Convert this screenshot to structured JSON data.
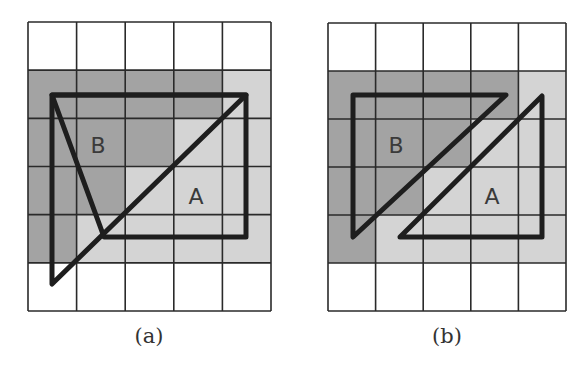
{
  "figure": {
    "colors": {
      "background": "#ffffff",
      "dark_cell": "#a3a3a3",
      "light_cell": "#d4d4d4",
      "grid_line": "#2a2a2a",
      "outline": "#1e1e1e",
      "text": "#3a3a3a"
    },
    "grid": {
      "cols": 5,
      "rows": 6
    },
    "cell_shading": [
      [
        "white",
        "white",
        "white",
        "white",
        "white"
      ],
      [
        "dark",
        "dark",
        "dark",
        "dark",
        "light"
      ],
      [
        "dark",
        "dark",
        "dark",
        "light",
        "light"
      ],
      [
        "dark",
        "dark",
        "light",
        "light",
        "light"
      ],
      [
        "dark",
        "light",
        "light",
        "light",
        "light"
      ],
      [
        "white",
        "white",
        "white",
        "white",
        "white"
      ]
    ],
    "panels": [
      {
        "id": "a",
        "caption": "(a)",
        "grid_box": {
          "x": 28,
          "y": 22,
          "w": 243,
          "h": 289
        },
        "caption_pos": {
          "x": 149,
          "y": 343
        },
        "shapes": [
          {
            "name": "region-outline",
            "points": [
              [
                52,
                95
              ],
              [
                246,
                95
              ],
              [
                246,
                237
              ],
              [
                104,
                237
              ]
            ]
          },
          {
            "name": "diagonal-b-triangle",
            "points": [
              [
                52,
                95
              ],
              [
                246,
                95
              ],
              [
                52,
                284
              ]
            ]
          }
        ],
        "labels": [
          {
            "text": "B",
            "x": 98,
            "y": 153
          },
          {
            "text": "A",
            "x": 196,
            "y": 204
          }
        ]
      },
      {
        "id": "b",
        "caption": "(b)",
        "grid_box": {
          "x": 328,
          "y": 23,
          "w": 238,
          "h": 288
        },
        "caption_pos": {
          "x": 447,
          "y": 343
        },
        "shapes": [
          {
            "name": "triangle-b",
            "points": [
              [
                353,
                95
              ],
              [
                506,
                95
              ],
              [
                353,
                237
              ]
            ]
          },
          {
            "name": "triangle-a",
            "points": [
              [
                542,
                96
              ],
              [
                542,
                237
              ],
              [
                400,
                237
              ]
            ]
          }
        ],
        "labels": [
          {
            "text": "B",
            "x": 396,
            "y": 153
          },
          {
            "text": "A",
            "x": 492,
            "y": 204
          }
        ]
      }
    ]
  }
}
